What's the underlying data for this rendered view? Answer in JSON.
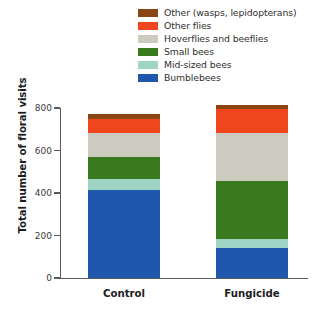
{
  "chart_data": {
    "type": "bar",
    "subtype": "stacked-vertical",
    "title": "",
    "xlabel": "",
    "ylabel": "Total number of floral visits",
    "categories": [
      "Control",
      "Fungicide"
    ],
    "ylim": [
      0,
      800
    ],
    "yticks": [
      0,
      200,
      400,
      600,
      800
    ],
    "ytick_labels": [
      "0",
      "200",
      "400",
      "600",
      "800"
    ],
    "grid": false,
    "legend_position": "top-right",
    "stack_order_bottom_to_top": [
      "Bumblebees",
      "Mid-sized bees",
      "Small bees",
      "Hoverflies and beeflies",
      "Other flies",
      "Other (wasps, lepidopterans)"
    ],
    "series": [
      {
        "name": "Bumblebees",
        "color": "#1f57ad",
        "values": [
          414,
          141
        ]
      },
      {
        "name": "Mid-sized bees",
        "color": "#9ed4c4",
        "values": [
          52,
          42
        ]
      },
      {
        "name": "Small bees",
        "color": "#3a7a1e",
        "values": [
          104,
          273
        ]
      },
      {
        "name": "Hoverflies and beeflies",
        "color": "#cdcbc0",
        "values": [
          113,
          226
        ]
      },
      {
        "name": "Other flies",
        "color": "#f0461d",
        "values": [
          66,
          113
        ]
      },
      {
        "name": "Other (wasps, lepidopterans)",
        "color": "#8a4612",
        "values": [
          24,
          19
        ]
      }
    ],
    "totals": [
      773,
      814
    ]
  },
  "legend": {
    "items": [
      {
        "label": "Other (wasps, lepidopterans)",
        "color": "#8a4612"
      },
      {
        "label": "Other flies",
        "color": "#f0461d"
      },
      {
        "label": "Hoverflies and beeflies",
        "color": "#cdcbc0"
      },
      {
        "label": "Small bees",
        "color": "#3a7a1e"
      },
      {
        "label": "Mid-sized bees",
        "color": "#9ed4c4"
      },
      {
        "label": "Bumblebees",
        "color": "#1f57ad"
      }
    ]
  },
  "axes": {
    "y_label": "Total number of floral visits",
    "y_ticks": [
      "800",
      "600",
      "400",
      "200",
      "0"
    ],
    "x_labels": [
      "Control",
      "Fungicide"
    ]
  },
  "colors": {
    "axis": "#5a5a5a",
    "text": "#1d1d1d",
    "background": "#ffffff"
  }
}
